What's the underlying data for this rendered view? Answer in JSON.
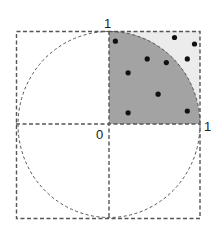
{
  "diagram": {
    "type": "monte-carlo-pi-estimation",
    "colors": {
      "background": "#ffffff",
      "quarter_circle_fill": "#a3a3a3",
      "square_remainder_fill": "#ececec",
      "dashed_line": "#555555",
      "point": "#111111",
      "label": "#222222"
    },
    "labels": {
      "top": "1",
      "origin": "0",
      "right": "1"
    },
    "points": [
      {
        "x": 0.07,
        "y": 0.89
      },
      {
        "x": 0.72,
        "y": 0.93
      },
      {
        "x": 0.94,
        "y": 0.86
      },
      {
        "x": 0.42,
        "y": 0.7
      },
      {
        "x": 0.63,
        "y": 0.66
      },
      {
        "x": 0.86,
        "y": 0.7
      },
      {
        "x": 0.21,
        "y": 0.55
      },
      {
        "x": 0.54,
        "y": 0.32
      },
      {
        "x": 0.21,
        "y": 0.12
      },
      {
        "x": 0.86,
        "y": 0.14
      }
    ]
  }
}
